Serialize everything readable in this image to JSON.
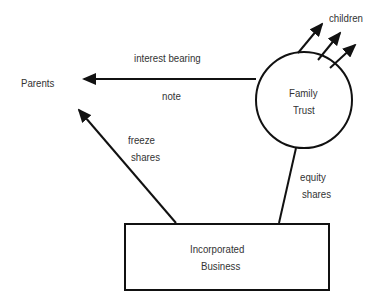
{
  "diagram": {
    "nodes": {
      "parents": {
        "label": "Parents"
      },
      "family_trust": {
        "line1": "Family",
        "line2": "Trust"
      },
      "business": {
        "line1": "Incorporated",
        "line2": "Business"
      },
      "children": {
        "label": "children"
      }
    },
    "edges": {
      "note": {
        "line1": "interest bearing",
        "line2": "note"
      },
      "freeze": {
        "line1": "freeze",
        "line2": "shares"
      },
      "equity": {
        "line1": "equity",
        "line2": "shares"
      }
    },
    "colors": {
      "stroke": "#111111",
      "text": "#333333",
      "background": "#ffffff"
    }
  }
}
